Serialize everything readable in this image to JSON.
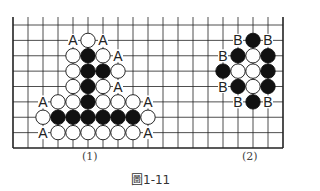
{
  "figure": {
    "caption": "圖1-11",
    "subfigure_labels": [
      "(1)",
      "(2)"
    ]
  },
  "board": {
    "columns": 19,
    "rows": 9,
    "origin_x": 13,
    "origin_y": 25,
    "spacing_x": 15,
    "spacing_y": 15.375,
    "top_extension": 8,
    "edges": [
      "left",
      "right",
      "bottom"
    ],
    "stone_radius": 7.2,
    "colors": {
      "line": "#222222",
      "black": "#111111",
      "white": "#ffffff",
      "label": "#222222"
    }
  },
  "diagram1": {
    "label": "(1)",
    "stones": [
      {
        "col": 5,
        "row": 1,
        "color": "white"
      },
      {
        "col": 4,
        "row": 2,
        "color": "white"
      },
      {
        "col": 5,
        "row": 2,
        "color": "black"
      },
      {
        "col": 6,
        "row": 2,
        "color": "white"
      },
      {
        "col": 4,
        "row": 3,
        "color": "white"
      },
      {
        "col": 5,
        "row": 3,
        "color": "black"
      },
      {
        "col": 6,
        "row": 3,
        "color": "black"
      },
      {
        "col": 7,
        "row": 3,
        "color": "white"
      },
      {
        "col": 4,
        "row": 4,
        "color": "white"
      },
      {
        "col": 5,
        "row": 4,
        "color": "black"
      },
      {
        "col": 6,
        "row": 4,
        "color": "white"
      },
      {
        "col": 3,
        "row": 5,
        "color": "white"
      },
      {
        "col": 4,
        "row": 5,
        "color": "white"
      },
      {
        "col": 5,
        "row": 5,
        "color": "black"
      },
      {
        "col": 6,
        "row": 5,
        "color": "white"
      },
      {
        "col": 7,
        "row": 5,
        "color": "white"
      },
      {
        "col": 8,
        "row": 5,
        "color": "white"
      },
      {
        "col": 2,
        "row": 6,
        "color": "white"
      },
      {
        "col": 3,
        "row": 6,
        "color": "black"
      },
      {
        "col": 4,
        "row": 6,
        "color": "black"
      },
      {
        "col": 5,
        "row": 6,
        "color": "black"
      },
      {
        "col": 6,
        "row": 6,
        "color": "black"
      },
      {
        "col": 7,
        "row": 6,
        "color": "black"
      },
      {
        "col": 8,
        "row": 6,
        "color": "black"
      },
      {
        "col": 9,
        "row": 6,
        "color": "white"
      },
      {
        "col": 3,
        "row": 7,
        "color": "white"
      },
      {
        "col": 4,
        "row": 7,
        "color": "white"
      },
      {
        "col": 5,
        "row": 7,
        "color": "white"
      },
      {
        "col": 6,
        "row": 7,
        "color": "white"
      },
      {
        "col": 7,
        "row": 7,
        "color": "white"
      },
      {
        "col": 8,
        "row": 7,
        "color": "white"
      }
    ],
    "marks": [
      {
        "col": 4,
        "row": 1,
        "text": "A"
      },
      {
        "col": 6,
        "row": 1,
        "text": "A"
      },
      {
        "col": 7,
        "row": 2,
        "text": "A"
      },
      {
        "col": 7,
        "row": 4,
        "text": "A"
      },
      {
        "col": 2,
        "row": 5,
        "text": "A"
      },
      {
        "col": 9,
        "row": 5,
        "text": "A"
      },
      {
        "col": 2,
        "row": 7,
        "text": "A"
      },
      {
        "col": 9,
        "row": 7,
        "text": "A"
      }
    ]
  },
  "diagram2": {
    "label": "(2)",
    "stones": [
      {
        "col": 16,
        "row": 1,
        "color": "black"
      },
      {
        "col": 15,
        "row": 2,
        "color": "black"
      },
      {
        "col": 16,
        "row": 2,
        "color": "white"
      },
      {
        "col": 17,
        "row": 2,
        "color": "black"
      },
      {
        "col": 14,
        "row": 3,
        "color": "black"
      },
      {
        "col": 15,
        "row": 3,
        "color": "white"
      },
      {
        "col": 16,
        "row": 3,
        "color": "white"
      },
      {
        "col": 17,
        "row": 3,
        "color": "black"
      },
      {
        "col": 15,
        "row": 4,
        "color": "black"
      },
      {
        "col": 16,
        "row": 4,
        "color": "white"
      },
      {
        "col": 17,
        "row": 4,
        "color": "black"
      },
      {
        "col": 16,
        "row": 5,
        "color": "black"
      }
    ],
    "marks": [
      {
        "col": 15,
        "row": 1,
        "text": "B"
      },
      {
        "col": 17,
        "row": 1,
        "text": "B"
      },
      {
        "col": 14,
        "row": 2,
        "text": "B"
      },
      {
        "col": 14,
        "row": 4,
        "text": "B"
      },
      {
        "col": 15,
        "row": 5,
        "text": "B"
      },
      {
        "col": 17,
        "row": 5,
        "text": "B"
      }
    ]
  }
}
